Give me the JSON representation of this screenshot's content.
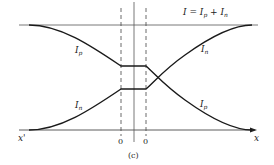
{
  "figure": {
    "caption": "(c)",
    "total_current_label": {
      "main": "I = I",
      "sub1": "p",
      "plus": " + I",
      "sub2": "n"
    },
    "curve_labels": [
      {
        "id": "ip_left",
        "main": "I",
        "sub": "p"
      },
      {
        "id": "in_right",
        "main": "I",
        "sub": "n"
      },
      {
        "id": "in_left",
        "main": "I",
        "sub": "n"
      },
      {
        "id": "ip_right",
        "main": "I",
        "sub": "p"
      }
    ],
    "axis": {
      "left_label": "x'",
      "right_label": "x"
    },
    "boundary_labels": [
      "0",
      "0"
    ],
    "colors": {
      "line": "#1a1a1a",
      "guide": "#555555"
    }
  }
}
